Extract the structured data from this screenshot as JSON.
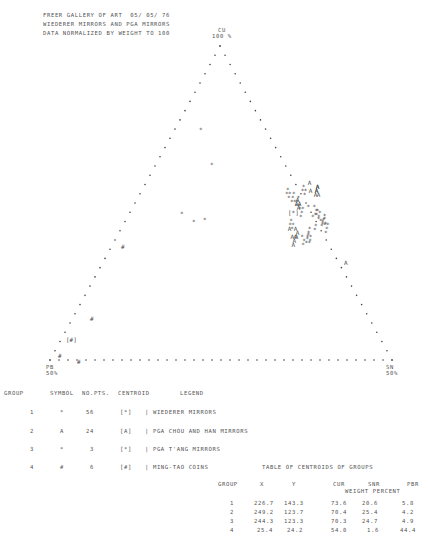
{
  "header": {
    "line1": "FREER GALLERY OF ART  05/ 05/ 76",
    "line2": "WIEDERER MIRRORS AND PGA MIRRORS",
    "line3": "DATA NORMALIZED BY WEIGHT TO 100"
  },
  "vertices": {
    "top": {
      "name": "CU",
      "pct": "100 %"
    },
    "left": {
      "name": "PB",
      "pct": "50%"
    },
    "right": {
      "name": "SN",
      "pct": "50%"
    }
  },
  "legend": {
    "headers": [
      "GROUP",
      "SYMBOL",
      "NO.PTS.",
      "CENTROID",
      "LEGEND"
    ],
    "rows": [
      {
        "group": "1",
        "symbol": "*",
        "npts": "56",
        "centroid": "[*]",
        "label": "| WIEDERER MIRRORS"
      },
      {
        "group": "2",
        "symbol": "A",
        "npts": "24",
        "centroid": "[A]",
        "label": "| PGA CHOU AND HAN MIRRORS"
      },
      {
        "group": "3",
        "symbol": "*",
        "npts": "3",
        "centroid": "[*]",
        "label": "| PGA T'ANG MIRRORS"
      },
      {
        "group": "4",
        "symbol": "#",
        "npts": "6",
        "centroid": "[#]",
        "label": "| MING-TAO COINS"
      }
    ]
  },
  "centroid_table": {
    "title": "TABLE OF CENTROIDS OF GROUPS",
    "headers": [
      "GROUP",
      "X",
      "Y",
      "CUR",
      "SNR",
      "PBR"
    ],
    "subheader": "WEIGHT PERCENT",
    "rows": [
      [
        "1",
        "226.7",
        "143.3",
        "73.6",
        "20.6",
        "5.8"
      ],
      [
        "2",
        "249.2",
        "123.7",
        "70.4",
        "25.4",
        "4.2"
      ],
      [
        "3",
        "244.3",
        "123.3",
        "70.3",
        "24.7",
        "4.9"
      ],
      [
        "4",
        "25.4",
        "24.2",
        "54.0",
        "1.6",
        "44.4"
      ]
    ]
  },
  "chart_data": {
    "type": "scatter",
    "subtype": "ternary",
    "axes": [
      "CU (top, 100%)",
      "PB (bottom-left, 50%)",
      "SN (bottom-right, 50%)"
    ],
    "series": [
      {
        "name": "WIEDERER MIRRORS",
        "symbol": "*",
        "n": 56,
        "centroid": {
          "x": 226.7,
          "y": 143.3,
          "CU": 73.6,
          "SN": 20.6,
          "PB": 5.8
        }
      },
      {
        "name": "PGA CHOU AND HAN MIRRORS",
        "symbol": "A",
        "n": 24,
        "centroid": {
          "x": 249.2,
          "y": 123.7,
          "CU": 70.4,
          "SN": 25.4,
          "PB": 4.2
        }
      },
      {
        "name": "PGA T'ANG MIRRORS",
        "symbol": "*",
        "n": 3,
        "centroid": {
          "x": 244.3,
          "y": 123.3,
          "CU": 70.3,
          "SN": 24.7,
          "PB": 4.9
        }
      },
      {
        "name": "MING-TAO COINS",
        "symbol": "#",
        "n": 6,
        "centroid": {
          "x": 25.4,
          "y": 24.2,
          "CU": 54.0,
          "SN": 1.6,
          "PB": 44.4
        }
      }
    ],
    "grid": false,
    "legend_position": "below"
  }
}
